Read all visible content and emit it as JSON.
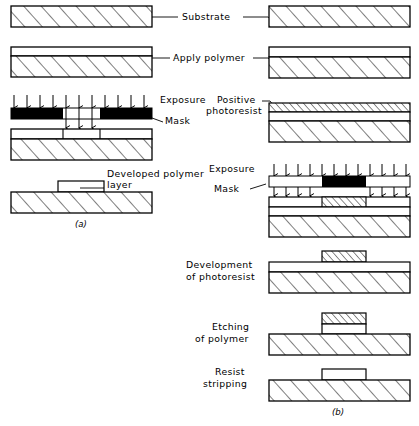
{
  "figure": {
    "panels": [
      {
        "id": "a",
        "caption": "(a)"
      },
      {
        "id": "b",
        "caption": "(b)"
      }
    ],
    "colors": {
      "line": "#000000",
      "hatch": "#000000",
      "mask_opaque": "#000000",
      "fill_clear": "#ffffff"
    }
  },
  "labels": {
    "substrate": "Substrate",
    "apply_polymer": "Apply polymer",
    "exposure_left": "Exposure",
    "mask_left": "Mask",
    "developed_polymer_line1": "Developed  polymer",
    "developed_polymer_line2": "layer",
    "positive_photoresist_line1": "Positive",
    "positive_photoresist_line2": "photoresist",
    "exposure_right": "Exposure",
    "mask_right": "Mask",
    "development_line1": "Development",
    "development_line2": "of photoresist",
    "etching_line1": "Etching",
    "etching_line2": "of polymer",
    "resist_line1": "Resist",
    "resist_line2": "stripping",
    "panel_a": "(a)",
    "panel_b": "(b)"
  },
  "steps_left": [
    {
      "name": "substrate",
      "label": "Substrate"
    },
    {
      "name": "apply-polymer",
      "label": "Apply polymer"
    },
    {
      "name": "exposure-mask",
      "label": "Exposure"
    },
    {
      "name": "developed-polymer-layer",
      "label": "Developed polymer layer"
    }
  ],
  "steps_right": [
    {
      "name": "substrate",
      "label": "Substrate"
    },
    {
      "name": "apply-polymer",
      "label": "Apply polymer"
    },
    {
      "name": "positive-photoresist",
      "label": "Positive photoresist"
    },
    {
      "name": "exposure-mask",
      "label": "Exposure"
    },
    {
      "name": "development-of-photoresist",
      "label": "Development of photoresist"
    },
    {
      "name": "etching-of-polymer",
      "label": "Etching of polymer"
    },
    {
      "name": "resist-stripping",
      "label": "Resist stripping"
    }
  ]
}
